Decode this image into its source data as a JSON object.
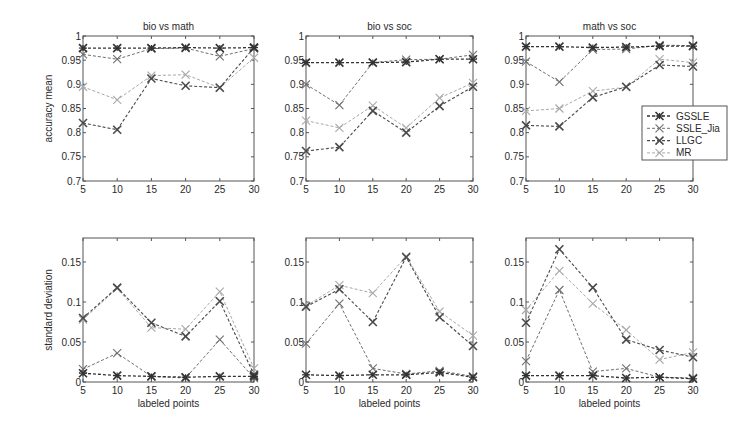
{
  "figure": {
    "legend": {
      "entries": [
        "GSSLE",
        "SSLE_Jia",
        "LLGC",
        "MR"
      ]
    },
    "series_styles": {
      "GSSLE": {
        "color": "#333333",
        "marker": "star",
        "width": 1.3
      },
      "SSLE_Jia": {
        "color": "#6e6e6e",
        "marker": "x",
        "width": 1.0
      },
      "LLGC": {
        "color": "#4a4a4a",
        "marker": "x-bold",
        "width": 1.1
      },
      "MR": {
        "color": "#a8a8a8",
        "marker": "x",
        "width": 1.0
      }
    },
    "frame_color": "#555555"
  },
  "chart_data": [
    {
      "type": "line",
      "title": "bio vs math",
      "xlabel": "",
      "ylabel": "accuracy mean",
      "x": [
        5,
        10,
        15,
        20,
        25,
        30
      ],
      "xlim": [
        5,
        30
      ],
      "ylim": [
        0.7,
        1.0
      ],
      "yticks": [
        0.7,
        0.75,
        0.8,
        0.85,
        0.9,
        0.95,
        1
      ],
      "ytick_labels": [
        "0.7",
        "0.75",
        "0.8",
        "0.85",
        "0.9",
        "0.95",
        "1"
      ],
      "xticks": [
        5,
        10,
        15,
        20,
        25,
        30
      ],
      "series": [
        {
          "name": "GSSLE",
          "values": [
            0.975,
            0.975,
            0.975,
            0.976,
            0.975,
            0.976
          ]
        },
        {
          "name": "SSLE_Jia",
          "values": [
            0.962,
            0.952,
            0.974,
            0.975,
            0.958,
            0.974
          ]
        },
        {
          "name": "LLGC",
          "values": [
            0.82,
            0.806,
            0.912,
            0.897,
            0.893,
            0.976
          ]
        },
        {
          "name": "MR",
          "values": [
            0.895,
            0.868,
            0.918,
            0.92,
            0.893,
            0.955
          ]
        }
      ]
    },
    {
      "type": "line",
      "title": "bio vs soc",
      "xlabel": "",
      "ylabel": "",
      "x": [
        5,
        10,
        15,
        20,
        25,
        30
      ],
      "xlim": [
        5,
        30
      ],
      "ylim": [
        0.7,
        1.0
      ],
      "yticks": [
        0.7,
        0.75,
        0.8,
        0.85,
        0.9,
        0.95,
        1
      ],
      "ytick_labels": [
        "0.7",
        "0.75",
        "0.8",
        "0.85",
        "0.9",
        "0.95",
        "1"
      ],
      "xticks": [
        5,
        10,
        15,
        20,
        25,
        30
      ],
      "series": [
        {
          "name": "GSSLE",
          "values": [
            0.945,
            0.945,
            0.945,
            0.946,
            0.952,
            0.952
          ]
        },
        {
          "name": "SSLE_Jia",
          "values": [
            0.9,
            0.857,
            0.945,
            0.951,
            0.952,
            0.961
          ]
        },
        {
          "name": "LLGC",
          "values": [
            0.762,
            0.77,
            0.845,
            0.8,
            0.855,
            0.895
          ]
        },
        {
          "name": "MR",
          "values": [
            0.825,
            0.81,
            0.856,
            0.81,
            0.872,
            0.903
          ]
        }
      ]
    },
    {
      "type": "line",
      "title": "math vs soc",
      "xlabel": "",
      "ylabel": "",
      "x": [
        5,
        10,
        15,
        20,
        25,
        30
      ],
      "xlim": [
        5,
        30
      ],
      "ylim": [
        0.7,
        1.0
      ],
      "yticks": [
        0.7,
        0.75,
        0.8,
        0.85,
        0.9,
        0.95,
        1
      ],
      "ytick_labels": [
        "0.7",
        "0.75",
        "0.8",
        "0.85",
        "0.9",
        "0.95",
        "1"
      ],
      "xticks": [
        5,
        10,
        15,
        20,
        25,
        30
      ],
      "legend_position": "east",
      "series": [
        {
          "name": "GSSLE",
          "values": [
            0.978,
            0.978,
            0.976,
            0.977,
            0.979,
            0.979
          ]
        },
        {
          "name": "SSLE_Jia",
          "values": [
            0.947,
            0.905,
            0.972,
            0.973,
            0.981,
            0.98
          ]
        },
        {
          "name": "LLGC",
          "values": [
            0.815,
            0.813,
            0.873,
            0.895,
            0.94,
            0.937
          ]
        },
        {
          "name": "MR",
          "values": [
            0.845,
            0.85,
            0.886,
            0.894,
            0.952,
            0.945
          ]
        }
      ]
    },
    {
      "type": "line",
      "title": "",
      "xlabel": "labeled points",
      "ylabel": "standard deviation",
      "x": [
        5,
        10,
        15,
        20,
        25,
        30
      ],
      "xlim": [
        5,
        30
      ],
      "ylim": [
        0,
        0.18
      ],
      "yticks": [
        0,
        0.05,
        0.1,
        0.15
      ],
      "ytick_labels": [
        "0",
        "0.05",
        "0.1",
        "0.15"
      ],
      "xticks": [
        5,
        10,
        15,
        20,
        25,
        30
      ],
      "series": [
        {
          "name": "GSSLE",
          "values": [
            0.011,
            0.008,
            0.007,
            0.006,
            0.007,
            0.007
          ]
        },
        {
          "name": "SSLE_Jia",
          "values": [
            0.016,
            0.036,
            0.007,
            0.005,
            0.053,
            0.005
          ]
        },
        {
          "name": "LLGC",
          "values": [
            0.08,
            0.118,
            0.074,
            0.057,
            0.101,
            0.009
          ]
        },
        {
          "name": "MR",
          "values": [
            0.078,
            0.117,
            0.068,
            0.066,
            0.113,
            0.017
          ]
        }
      ]
    },
    {
      "type": "line",
      "title": "",
      "xlabel": "labeled points",
      "ylabel": "",
      "x": [
        5,
        10,
        15,
        20,
        25,
        30
      ],
      "xlim": [
        5,
        30
      ],
      "ylim": [
        0,
        0.18
      ],
      "yticks": [
        0,
        0.05,
        0.1,
        0.15
      ],
      "ytick_labels": [
        "0",
        "0.05",
        "0.1",
        "0.15"
      ],
      "xticks": [
        5,
        10,
        15,
        20,
        25,
        30
      ],
      "series": [
        {
          "name": "GSSLE",
          "values": [
            0.009,
            0.008,
            0.009,
            0.009,
            0.012,
            0.006
          ]
        },
        {
          "name": "SSLE_Jia",
          "values": [
            0.048,
            0.098,
            0.017,
            0.01,
            0.014,
            0.007
          ]
        },
        {
          "name": "LLGC",
          "values": [
            0.094,
            0.116,
            0.075,
            0.156,
            0.081,
            0.045
          ]
        },
        {
          "name": "MR",
          "values": [
            0.095,
            0.121,
            0.111,
            0.157,
            0.088,
            0.058
          ]
        }
      ]
    },
    {
      "type": "line",
      "title": "",
      "xlabel": "labeled points",
      "ylabel": "",
      "x": [
        5,
        10,
        15,
        20,
        25,
        30
      ],
      "xlim": [
        5,
        30
      ],
      "ylim": [
        0,
        0.18
      ],
      "yticks": [
        0,
        0.05,
        0.1,
        0.15
      ],
      "ytick_labels": [
        "0",
        "0.05",
        "0.1",
        "0.15"
      ],
      "xticks": [
        5,
        10,
        15,
        20,
        25,
        30
      ],
      "series": [
        {
          "name": "GSSLE",
          "values": [
            0.008,
            0.008,
            0.008,
            0.005,
            0.006,
            0.004
          ]
        },
        {
          "name": "SSLE_Jia",
          "values": [
            0.026,
            0.115,
            0.013,
            0.017,
            0.006,
            0.005
          ]
        },
        {
          "name": "LLGC",
          "values": [
            0.074,
            0.166,
            0.118,
            0.053,
            0.04,
            0.031
          ]
        },
        {
          "name": "MR",
          "values": [
            0.09,
            0.139,
            0.098,
            0.065,
            0.028,
            0.037
          ]
        }
      ]
    }
  ]
}
